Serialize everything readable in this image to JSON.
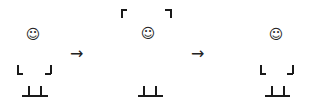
{
  "diagram": {
    "stages": [
      {
        "label": "stage-1",
        "face": "☺",
        "arms": "down"
      },
      {
        "label": "stage-2",
        "face": "☺",
        "arms": "up"
      },
      {
        "label": "stage-3",
        "face": "☺",
        "arms": "down"
      }
    ],
    "arrows": [
      "→",
      "→"
    ]
  }
}
